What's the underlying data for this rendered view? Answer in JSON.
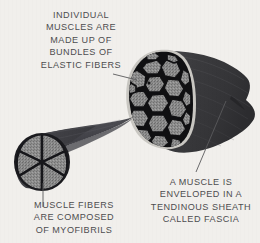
{
  "figure": {
    "background_color": "#f1efec",
    "text_color": "#4d4d4f"
  },
  "captions": {
    "top": {
      "name": "elastic-fibers-caption",
      "lines": [
        "INDIVIDUAL",
        "MUSCLES ARE",
        "MADE UP OF",
        "BUNDLES OF",
        "ELASTIC FIBERS"
      ]
    },
    "right": {
      "name": "fascia-caption",
      "lines": [
        "A MUSCLE IS",
        "ENVELOPED IN A",
        "TENDINOUS SHEATH",
        "CALLED FASCIA"
      ]
    },
    "bottom": {
      "name": "myofibrils-caption",
      "lines": [
        "MUSCLE FIBERS",
        "ARE COMPOSED",
        "OF MYOFIBRILS"
      ]
    }
  },
  "illustration": {
    "large_muscle": {
      "name": "muscle-cross-section",
      "description": "Cut-away muscle belly showing polygonal fascicles inside a fascia sheath",
      "body_color": "#3a3a3c",
      "fascicle_fill": "#8b8b8b",
      "fascicle_outline": "#141416",
      "fascia_rim_color": "#c9c7c2"
    },
    "small_muscle": {
      "name": "muscle-tendon-taper",
      "description": "Tapering muscle bundle joining a tendon, six fascicles visible at cut end",
      "body_color": "#45454a",
      "fascicle_fill": "#8b8b8b",
      "fascicle_outline": "#16161a"
    },
    "leader_lines": [
      {
        "name": "leader-line-elastic-fibers",
        "color": "#5a5a5c"
      },
      {
        "name": "leader-line-fascia",
        "color": "#5a5a5c"
      },
      {
        "name": "leader-line-myofibrils",
        "color": "#5a5a5c"
      }
    ]
  }
}
